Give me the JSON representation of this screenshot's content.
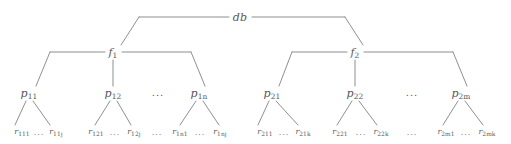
{
  "diagram": {
    "kind": "hierarchy-tree",
    "line_color": "#808285",
    "text_color": "#58585a",
    "background_color": "#ffffff",
    "levels": [
      {
        "name": "database",
        "y": 17
      },
      {
        "name": "files",
        "y": 52
      },
      {
        "name": "pages",
        "y": 93
      },
      {
        "name": "records",
        "y": 132
      }
    ]
  },
  "nodes": {
    "root": {
      "base": "db",
      "sub": "",
      "x": 240,
      "y": 17
    },
    "files": [
      {
        "base": "f",
        "sub": "1",
        "x": 113,
        "y": 52
      },
      {
        "base": "f",
        "sub": "2",
        "x": 355,
        "y": 52
      }
    ],
    "pages": [
      {
        "base": "p",
        "sub": "11",
        "x": 29,
        "y": 93
      },
      {
        "base": "p",
        "sub": "12",
        "x": 113,
        "y": 93
      },
      {
        "base": "p",
        "sub": "1n",
        "x": 199,
        "y": 93
      },
      {
        "base": "p",
        "sub": "21",
        "x": 272,
        "y": 93
      },
      {
        "base": "p",
        "sub": "22",
        "x": 355,
        "y": 93
      },
      {
        "base": "p",
        "sub": "2m",
        "x": 461,
        "y": 93
      }
    ],
    "records": [
      {
        "base": "r",
        "sub": "111",
        "x": 22,
        "y": 132
      },
      {
        "base": "r",
        "sub": "11j",
        "x": 56,
        "y": 132
      },
      {
        "base": "r",
        "sub": "121",
        "x": 96,
        "y": 132
      },
      {
        "base": "r",
        "sub": "12j",
        "x": 134,
        "y": 132
      },
      {
        "base": "r",
        "sub": "1n1",
        "x": 180,
        "y": 132
      },
      {
        "base": "r",
        "sub": "1nj",
        "x": 220,
        "y": 132
      },
      {
        "base": "r",
        "sub": "211",
        "x": 265,
        "y": 132
      },
      {
        "base": "r",
        "sub": "21k",
        "x": 303,
        "y": 132
      },
      {
        "base": "r",
        "sub": "221",
        "x": 340,
        "y": 132
      },
      {
        "base": "r",
        "sub": "22k",
        "x": 381,
        "y": 132
      },
      {
        "base": "r",
        "sub": "2m1",
        "x": 446,
        "y": 132
      },
      {
        "base": "r",
        "sub": "2mk",
        "x": 487,
        "y": 132
      }
    ]
  },
  "ellipses": [
    {
      "name": "pages-left-ellipsis",
      "text": "...",
      "x": 158,
      "y": 93,
      "level": "page"
    },
    {
      "name": "pages-right-ellipsis",
      "text": "...",
      "x": 412,
      "y": 93,
      "level": "page"
    },
    {
      "name": "records-1-1-ellipsis",
      "text": "...",
      "x": 39,
      "y": 133,
      "level": "rec"
    },
    {
      "name": "records-1-2-ellipsis",
      "text": "...",
      "x": 115,
      "y": 133,
      "level": "rec"
    },
    {
      "name": "records-1-mid-ellipsis",
      "text": "...",
      "x": 157,
      "y": 133,
      "level": "rec"
    },
    {
      "name": "records-1-n-ellipsis",
      "text": "...",
      "x": 200,
      "y": 133,
      "level": "rec"
    },
    {
      "name": "records-2-1-ellipsis",
      "text": "...",
      "x": 284,
      "y": 133,
      "level": "rec"
    },
    {
      "name": "records-2-2-ellipsis",
      "text": "...",
      "x": 361,
      "y": 133,
      "level": "rec"
    },
    {
      "name": "records-2-mid-ellipsis",
      "text": "...",
      "x": 412,
      "y": 133,
      "level": "rec"
    },
    {
      "name": "records-2-m-ellipsis",
      "text": "...",
      "x": 466,
      "y": 133,
      "level": "rec"
    }
  ],
  "edges": {
    "stroke_width": 0.9,
    "root_to_files": [
      {
        "name": "root-rail-left",
        "d": "M 229 17 L 139 17"
      },
      {
        "name": "root-rail-right",
        "d": "M 252 17 L 345 17"
      },
      {
        "name": "root-drop-left",
        "d": "M 139 17 L 121 45"
      },
      {
        "name": "root-drop-right",
        "d": "M 345 17 L 363 45"
      }
    ],
    "f1_to_pages": [
      {
        "name": "f1-rail-left",
        "d": "M 105 52 L 50 52"
      },
      {
        "name": "f1-rail-right",
        "d": "M 122 52 L 191 52"
      },
      {
        "name": "f1-drop-left",
        "d": "M 50 52 L 36 86"
      },
      {
        "name": "f1-drop-right",
        "d": "M 191 52 L 205 86"
      },
      {
        "name": "f1-stem-center",
        "d": "M 113 60 L 113 86"
      }
    ],
    "f2_to_pages": [
      {
        "name": "f2-rail-left",
        "d": "M 347 52 L 292 52"
      },
      {
        "name": "f2-rail-right",
        "d": "M 364 52 L 453 52"
      },
      {
        "name": "f2-drop-left",
        "d": "M 292 52 L 279 86"
      },
      {
        "name": "f2-drop-right",
        "d": "M 453 52 L 467 86"
      },
      {
        "name": "f2-stem-center",
        "d": "M 355 60 L 355 86"
      }
    ],
    "pages_to_records": [
      {
        "name": "p11-edge-left",
        "d": "M 26 101 L 15 125"
      },
      {
        "name": "p11-edge-right",
        "d": "M 33 101 L 50 125"
      },
      {
        "name": "p12-edge-left",
        "d": "M 110 101 L 95 125"
      },
      {
        "name": "p12-edge-right",
        "d": "M 117 101 L 131 125"
      },
      {
        "name": "p1n-edge-left",
        "d": "M 196 101 L 180 125"
      },
      {
        "name": "p1n-edge-right",
        "d": "M 203 101 L 219 125"
      },
      {
        "name": "p21-edge-left",
        "d": "M 269 101 L 258 125"
      },
      {
        "name": "p21-edge-right",
        "d": "M 276 101 L 298 125"
      },
      {
        "name": "p22-edge-left",
        "d": "M 352 101 L 337 125"
      },
      {
        "name": "p22-edge-right",
        "d": "M 359 101 L 377 125"
      },
      {
        "name": "p2m-edge-left",
        "d": "M 458 101 L 443 125"
      },
      {
        "name": "p2m-edge-right",
        "d": "M 465 101 L 483 125"
      }
    ]
  }
}
